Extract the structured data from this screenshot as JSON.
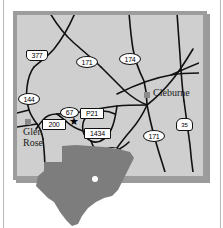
{
  "map": {
    "title": "Somervell / Johnson County area road map",
    "background_color": "#cfcfcf",
    "frame_color": "#9c9c9c",
    "road_color": "#111111",
    "cities": [
      {
        "name": "Cleburne",
        "marker": "gray-square"
      },
      {
        "name": "Glen\nRose",
        "marker": "gray-square"
      }
    ],
    "site_marker": "★",
    "highway_labels": [
      {
        "id": "us-377",
        "text": "377",
        "shape": "shield"
      },
      {
        "id": "sh-171-n",
        "text": "171",
        "shape": "oval"
      },
      {
        "id": "sh-174-n",
        "text": "174",
        "shape": "oval"
      },
      {
        "id": "fm-144",
        "text": "144",
        "shape": "oval"
      },
      {
        "id": "us-67",
        "text": "67",
        "shape": "oval"
      },
      {
        "id": "fm-p21",
        "text": "P21",
        "shape": "rect"
      },
      {
        "id": "fm-200",
        "text": "200",
        "shape": "rect"
      },
      {
        "id": "fm-1434",
        "text": "1434",
        "shape": "rect"
      },
      {
        "id": "sh-174-s",
        "text": "174",
        "shape": "oval"
      },
      {
        "id": "sh-171-s",
        "text": "171",
        "shape": "oval"
      },
      {
        "id": "ih-35",
        "text": "35",
        "shape": "interstate"
      }
    ],
    "inset": {
      "name": "Texas state outline",
      "fill": "#7d7d7d",
      "locator_dot": "white-dot"
    }
  }
}
